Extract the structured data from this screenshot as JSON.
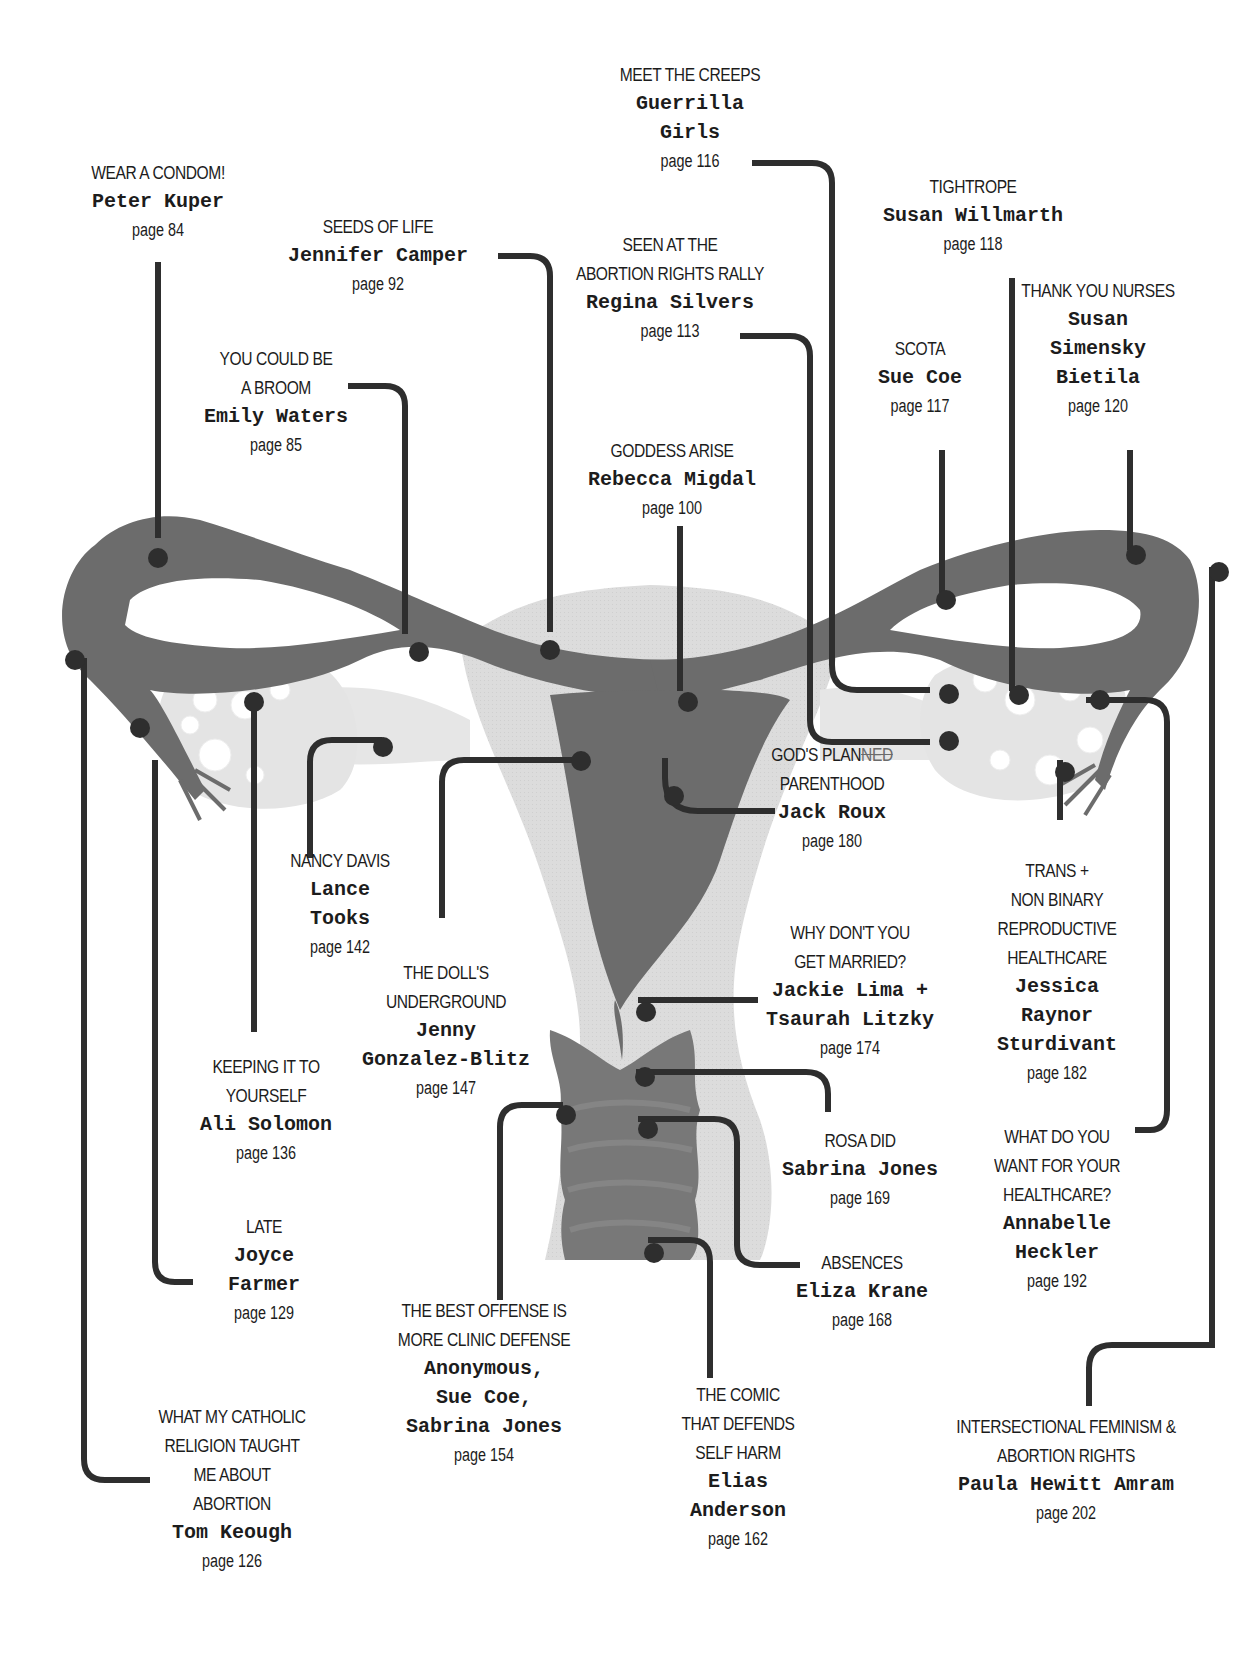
{
  "colors": {
    "background": "#ffffff",
    "leader_line": "#2e2e2e",
    "tube_dark": "#6c6c6c",
    "body_light": "#d9d9d9",
    "ovary_light": "#e4e4e4",
    "text": "#1c1c1c"
  },
  "entries": [
    {
      "id": "wear-a-condom",
      "title": [
        "WEAR A CONDOM!"
      ],
      "artist": [
        "Peter Kuper"
      ],
      "page": "page 84",
      "x": 158,
      "y": 150
    },
    {
      "id": "seeds-of-life",
      "title": [
        "SEEDS OF LIFE"
      ],
      "artist": [
        "Jennifer Camper"
      ],
      "page": "page 92",
      "x": 378,
      "y": 204
    },
    {
      "id": "you-could-be-a-broom",
      "title": [
        "YOU COULD BE",
        "A BROOM"
      ],
      "artist": [
        "Emily Waters"
      ],
      "page": "page 85",
      "x": 280,
      "y": 340
    },
    {
      "id": "meet-the-creeps",
      "title": [
        "MEET THE CREEPS"
      ],
      "artist": [
        "Guerrilla",
        "Girls"
      ],
      "page": "page 116",
      "x": 712,
      "y": 57
    },
    {
      "id": "seen-at-the-rally",
      "title": [
        "SEEN AT THE",
        "ABORTION RIGHTS RALLY"
      ],
      "artist": [
        "Regina Silvers"
      ],
      "page": "page 113",
      "x": 688,
      "y": 228
    },
    {
      "id": "goddess-arise",
      "title": [
        "GODDESS ARISE"
      ],
      "artist": [
        "Rebecca Migdal"
      ],
      "page": "page 100",
      "x": 692,
      "y": 434
    },
    {
      "id": "tightrope",
      "title": [
        "TIGHTROPE"
      ],
      "artist": [
        "Susan Willmarth"
      ],
      "page": "page 118",
      "x": 1003,
      "y": 168
    },
    {
      "id": "scota",
      "title": [
        "SCOTA"
      ],
      "artist": [
        "Sue Coe"
      ],
      "page": "page 117",
      "x": 947,
      "y": 332
    },
    {
      "id": "thank-you-nurses",
      "title": [
        "THANK YOU NURSES"
      ],
      "artist": [
        "Susan",
        "Simensky",
        "Bietila"
      ],
      "page": "page 120",
      "x": 1128,
      "y": 272
    },
    {
      "id": "gods-planned-parenthood",
      "title": [
        "GOD'S PLAN",
        "PARENTHOOD"
      ],
      "title_struck": "NED",
      "artist": [
        "Jack Roux"
      ],
      "page": "page 180",
      "x": 860,
      "y": 736
    },
    {
      "id": "nancy-davis",
      "title": [
        "NANCY DAVIS"
      ],
      "artist": [
        "Lance",
        "Tooks"
      ],
      "page": "page 142",
      "x": 340,
      "y": 840
    },
    {
      "id": "dolls-underground",
      "title": [
        "THE DOLL'S",
        "UNDERGROUND"
      ],
      "artist": [
        "Jenny",
        "Gonzalez-Blitz"
      ],
      "page": "page 147",
      "x": 447,
      "y": 956
    },
    {
      "id": "why-dont-you-get-married",
      "title": [
        "WHY DON'T YOU",
        "GET MARRIED?"
      ],
      "artist": [
        "Jackie Lima +",
        "Tsaurah Litzky"
      ],
      "page": "page 174",
      "x": 866,
      "y": 915
    },
    {
      "id": "trans-non-binary",
      "title": [
        "TRANS +",
        "NON BINARY",
        "REPRODUCTIVE",
        "HEALTHCARE"
      ],
      "artist": [
        "Jessica",
        "Raynor",
        "Sturdivant"
      ],
      "page": "page 182",
      "x": 1067,
      "y": 853
    },
    {
      "id": "keeping-it-to-yourself",
      "title": [
        "KEEPING IT TO",
        "YOURSELF"
      ],
      "artist": [
        "Ali Solomon"
      ],
      "page": "page 136",
      "x": 265,
      "y": 1049
    },
    {
      "id": "rosa-did",
      "title": [
        "ROSA DID"
      ],
      "artist": [
        "Sabrina Jones"
      ],
      "page": "page 169",
      "x": 867,
      "y": 1123
    },
    {
      "id": "what-do-you-want",
      "title": [
        "WHAT DO YOU",
        "WANT FOR YOUR",
        "HEALTHCARE?"
      ],
      "artist": [
        "Annabelle",
        "Heckler"
      ],
      "page": "page 192",
      "x": 1058,
      "y": 1120
    },
    {
      "id": "late",
      "title": [
        "LATE"
      ],
      "artist": [
        "Joyce",
        "Farmer"
      ],
      "page": "page 129",
      "x": 264,
      "y": 1208
    },
    {
      "id": "absences",
      "title": [
        "ABSENCES"
      ],
      "artist": [
        "Eliza Krane"
      ],
      "page": "page 168",
      "x": 869,
      "y": 1261
    },
    {
      "id": "best-offense",
      "title": [
        "THE BEST OFFENSE IS",
        "MORE CLINIC DEFENSE"
      ],
      "artist": [
        "Anonymous,",
        "Sue Coe,",
        "Sabrina Jones"
      ],
      "page": "page 154",
      "x": 486,
      "y": 1292
    },
    {
      "id": "comic-self-harm",
      "title": [
        "THE COMIC",
        "THAT DEFENDS",
        "SELF HARM"
      ],
      "artist": [
        "Elias",
        "Anderson"
      ],
      "page": "page 162",
      "x": 740,
      "y": 1378
    },
    {
      "id": "intersectional-feminism",
      "title": [
        "INTERSECTIONAL FEMINISM &",
        "ABORTION RIGHTS"
      ],
      "artist": [
        "Paula Hewitt Amram"
      ],
      "page": "page 202",
      "x": 1074,
      "y": 1407
    },
    {
      "id": "catholic-religion",
      "title": [
        "WHAT MY CATHOLIC",
        "RELIGION TAUGHT",
        "ME ABOUT",
        "ABORTION"
      ],
      "artist": [
        "Tom Keough"
      ],
      "page": "page 126",
      "x": 234,
      "y": 1398
    }
  ]
}
